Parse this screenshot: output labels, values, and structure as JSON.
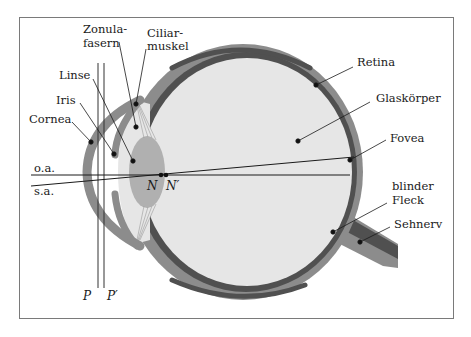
{
  "diagram": {
    "colors": {
      "frame": "#7a7a7a",
      "sclera": "#8c8c8c",
      "retina": "#505050",
      "vitreous": "#e6e6e6",
      "lens": "#b0b0b0",
      "leader": "#1a1a1a"
    },
    "labels": {
      "zonula_line1": "Zonula-",
      "zonula_line2": "fasern",
      "ciliar_line1": "Ciliar-",
      "ciliar_line2": "muskel",
      "linse": "Linse",
      "iris": "Iris",
      "cornea": "Cornea",
      "retina": "Retina",
      "glaskoerper": "Glaskörper",
      "fovea": "Fovea",
      "blinder_line1": "blinder",
      "blinder_line2": "Fleck",
      "sehnerv": "Sehnerv",
      "optical_axis": "o.a.",
      "visual_axis": "s.a.",
      "nodal_N": "N",
      "nodal_N_prime": "N′",
      "principal_P": "P",
      "principal_P_prime": "P′"
    }
  }
}
